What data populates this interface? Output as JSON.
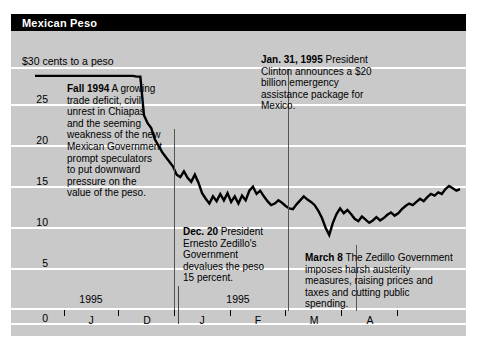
{
  "title": "Mexican Peso",
  "axis_top_label": "$30 cents to a peso",
  "y_ticks": [
    "25",
    "20",
    "15",
    "10",
    "5",
    "0"
  ],
  "x_labels": [
    "J",
    "D",
    "J",
    "F",
    "M",
    "A"
  ],
  "x_year_left": "1995",
  "x_year_right": "1995",
  "annotations": {
    "fall1994": {
      "lead": "Fall 1994",
      "body": " A growing trade deficit, civil unrest in Chiapas and the seeming weakness of the new Mexican Government prompt speculators to put downward pressure on the value of the peso."
    },
    "dec20": {
      "lead": "Dec. 20",
      "body": " President Ernesto Zedillo's Government devalues the peso 15 percent."
    },
    "jan31": {
      "lead": "Jan. 31, 1995",
      "body": " President Clinton announces a $20 billion emergency assistance package for Mexico."
    },
    "march8": {
      "lead": "March 8",
      "body": " The Zedillo Government imposes harsh austerity measures, raising prices and taxes and cutting public spending."
    }
  },
  "chart_data": {
    "type": "line",
    "title": "Mexican Peso",
    "ylabel": "$30 cents to a peso",
    "xlabel": "",
    "ylim": [
      0,
      30
    ],
    "yticks": [
      0,
      5,
      10,
      15,
      20,
      25
    ],
    "grid": true,
    "legend": "none",
    "xlabel_ticks": [
      "J",
      "D",
      "J",
      "F",
      "M",
      "A"
    ],
    "series": [
      {
        "name": "Mexican peso (US cents per peso)",
        "values": [
          28.9,
          28.9,
          28.9,
          28.9,
          28.9,
          28.9,
          28.9,
          28.9,
          28.9,
          28.9,
          28.9,
          28.9,
          28.9,
          28.9,
          28.9,
          28.9,
          28.9,
          28.9,
          28.9,
          28.9,
          28.9,
          28.9,
          28.9,
          28.9,
          28.9,
          28.9,
          28.9,
          28.9,
          28.8,
          28.8,
          24.0,
          23.0,
          22.4,
          21.0,
          20.2,
          19.4,
          18.8,
          18.2,
          17.6,
          16.6,
          16.3,
          17.0,
          16.2,
          15.7,
          16.6,
          15.6,
          14.3,
          13.6,
          13.0,
          13.9,
          13.3,
          14.2,
          13.4,
          14.3,
          13.2,
          13.9,
          13.0,
          14.0,
          13.4,
          14.6,
          15.1,
          14.2,
          14.6,
          13.9,
          13.3,
          12.8,
          13.0,
          13.4,
          13.1,
          12.7,
          12.4,
          12.3,
          12.9,
          13.4,
          13.9,
          13.5,
          13.2,
          12.8,
          12.1,
          11.2,
          10.0,
          9.1,
          10.6,
          11.7,
          12.4,
          11.8,
          12.2,
          11.7,
          11.1,
          10.8,
          11.4,
          11.0,
          10.6,
          10.9,
          11.3,
          10.9,
          11.2,
          11.6,
          11.9,
          11.5,
          11.8,
          12.3,
          12.7,
          13.0,
          12.8,
          13.2,
          13.6,
          13.3,
          13.8,
          14.2,
          14.0,
          14.4,
          14.2,
          14.8,
          15.2,
          14.9,
          14.6,
          14.8
        ]
      }
    ],
    "events": [
      {
        "label": "Dec. 20 devaluation",
        "x_fraction": 0.28
      },
      {
        "label": "Jan. 31, 1995 US aid package",
        "x_fraction": 0.62
      },
      {
        "label": "March 8 austerity measures",
        "x_fraction": 0.8
      }
    ]
  }
}
